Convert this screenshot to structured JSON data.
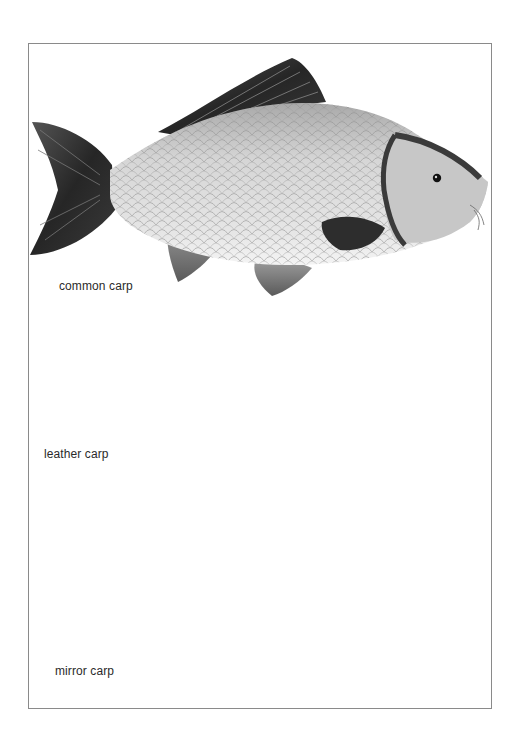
{
  "page": {
    "type": "illustration-plate",
    "background": "#ffffff",
    "frame_color": "#8a8a8a"
  },
  "fish": [
    {
      "id": "common",
      "label": "common carp",
      "tone": "light-scaled"
    },
    {
      "id": "leather",
      "label": "leather carp",
      "tone": "dark-scaleless"
    },
    {
      "id": "mirror",
      "label": "mirror carp",
      "tone": "medium-sparse-scales"
    }
  ],
  "colors": {
    "fin_dark": "#2b2b2b",
    "fin_mid": "#6a6a6a",
    "body_light": "#d9d9d9",
    "body_mid": "#9a9a9a",
    "body_dark": "#5e5e5e",
    "belly": "#eeeeee",
    "text": "#2a2a2a"
  }
}
